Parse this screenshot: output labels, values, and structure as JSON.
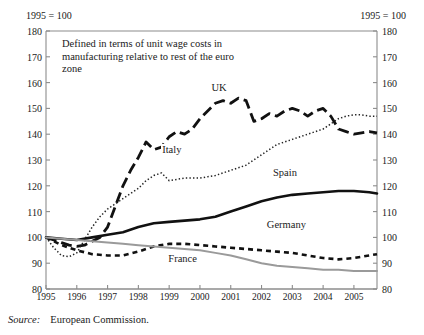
{
  "header": {
    "left_note": "1995 = 100",
    "right_note": "1995 = 100"
  },
  "annotation": "Defined in terms of unit wage costs in manufacturing relative to rest of the euro zone",
  "source": {
    "word": "Source:",
    "body": "European Commission."
  },
  "series_labels": {
    "uk": "UK",
    "italy": "Italy",
    "spain": "Spain",
    "germany": "Germany",
    "france": "France"
  },
  "chart_data": {
    "type": "line",
    "title": "",
    "subtitle": "1995 = 100",
    "xlabel": "",
    "ylabel": "1995 = 100",
    "xlim": [
      1995,
      2005.75
    ],
    "ylim": [
      80,
      180
    ],
    "ytick_step": 10,
    "yticks": [
      80,
      90,
      100,
      110,
      120,
      130,
      140,
      150,
      160,
      170,
      180
    ],
    "xticks": [
      1995,
      1996,
      1997,
      1998,
      1999,
      2000,
      2001,
      2002,
      2003,
      2004,
      2005
    ],
    "xtick_labels": [
      "1995",
      "1996",
      "1997",
      "1998",
      "1999",
      "2000",
      "2001",
      "2002",
      "2003",
      "2004",
      "2005"
    ],
    "grid": false,
    "legend": "inline-annotations",
    "dual_axis": true,
    "annotations": [
      "Defined in terms of unit wage costs in manufacturing relative to rest of the euro zone"
    ],
    "series": [
      {
        "name": "UK",
        "style": "thick-dashed",
        "color": "#111111",
        "x": [
          1995.0,
          1995.25,
          1995.5,
          1995.75,
          1996.0,
          1996.25,
          1996.5,
          1996.75,
          1997.0,
          1997.25,
          1997.5,
          1997.75,
          1998.0,
          1998.25,
          1998.5,
          1998.75,
          1999.0,
          1999.25,
          1999.5,
          1999.75,
          2000.0,
          2000.25,
          2000.5,
          2000.75,
          2001.0,
          2001.25,
          2001.5,
          2001.75,
          2002.0,
          2002.25,
          2002.5,
          2002.75,
          2003.0,
          2003.25,
          2003.5,
          2003.75,
          2004.0,
          2004.25,
          2004.5,
          2004.75,
          2005.0,
          2005.25,
          2005.5,
          2005.75
        ],
        "y": [
          100,
          99,
          98,
          97,
          96.5,
          97,
          98.5,
          100,
          104,
          112,
          120,
          126,
          131,
          137,
          134,
          135,
          139,
          141,
          140,
          142,
          146,
          149,
          152,
          153,
          152,
          154,
          153,
          145,
          146,
          148,
          147,
          149,
          150,
          149,
          147,
          149,
          150,
          147,
          142,
          141,
          140,
          140.5,
          141,
          140.5
        ]
      },
      {
        "name": "Italy",
        "style": "dotted",
        "color": "#222222",
        "x": [
          1995.0,
          1995.25,
          1995.5,
          1995.75,
          1996.0,
          1996.25,
          1996.5,
          1996.75,
          1997.0,
          1997.25,
          1997.5,
          1997.75,
          1998.0,
          1998.25,
          1998.5,
          1998.75,
          1999.0,
          1999.25,
          1999.5,
          1999.75,
          2000.0,
          2000.25,
          2000.5,
          2000.75,
          2001.0,
          2001.25,
          2001.5,
          2001.75,
          2002.0,
          2002.25,
          2002.5,
          2002.75,
          2003.0,
          2003.25,
          2003.5,
          2003.75,
          2004.0,
          2004.25,
          2004.5,
          2004.75,
          2005.0,
          2005.25,
          2005.5,
          2005.75
        ],
        "y": [
          100,
          96,
          93,
          92.5,
          94,
          99,
          104,
          108,
          111,
          113,
          115,
          117,
          119,
          122,
          124,
          125,
          122,
          122.5,
          123,
          123,
          123,
          123.5,
          124,
          125,
          126,
          127,
          128,
          130,
          132,
          134,
          136,
          137,
          138,
          139,
          140,
          141,
          142,
          144,
          146,
          147,
          147.5,
          147.5,
          147,
          147
        ]
      },
      {
        "name": "Spain",
        "style": "thick-solid",
        "color": "#111111",
        "x": [
          1995.0,
          1995.5,
          1996.0,
          1996.5,
          1997.0,
          1997.5,
          1998.0,
          1998.5,
          1999.0,
          1999.5,
          2000.0,
          2000.5,
          2001.0,
          2001.5,
          2002.0,
          2002.5,
          2003.0,
          2003.5,
          2004.0,
          2004.5,
          2005.0,
          2005.5,
          2005.75
        ],
        "y": [
          100,
          99.5,
          99,
          100,
          101,
          102,
          104,
          105.5,
          106,
          106.5,
          107,
          108,
          110,
          112,
          114,
          115.5,
          116.5,
          117,
          117.5,
          118,
          118,
          117.5,
          117
        ]
      },
      {
        "name": "Germany",
        "style": "thick-dashed-small",
        "color": "#111111",
        "x": [
          1995.0,
          1995.5,
          1996.0,
          1996.5,
          1997.0,
          1997.5,
          1998.0,
          1998.5,
          1999.0,
          1999.5,
          2000.0,
          2000.5,
          2001.0,
          2001.5,
          2002.0,
          2002.5,
          2003.0,
          2003.5,
          2004.0,
          2004.5,
          2005.0,
          2005.5,
          2005.75
        ],
        "y": [
          100,
          97,
          95,
          93.5,
          93,
          93,
          94.5,
          96.5,
          97.5,
          97.5,
          97,
          96.5,
          96,
          95.5,
          95,
          94.5,
          94,
          93,
          92,
          91.5,
          92,
          93,
          93.5
        ]
      },
      {
        "name": "France",
        "style": "solid-grey",
        "color": "#9a9a9a",
        "x": [
          1995.0,
          1995.5,
          1996.0,
          1996.5,
          1997.0,
          1997.5,
          1998.0,
          1998.5,
          1999.0,
          1999.5,
          2000.0,
          2000.5,
          2001.0,
          2001.5,
          2002.0,
          2002.5,
          2003.0,
          2003.5,
          2004.0,
          2004.5,
          2005.0,
          2005.5,
          2005.75
        ],
        "y": [
          100,
          99.5,
          99,
          98.5,
          98,
          97.5,
          97,
          96.5,
          96,
          95.5,
          95,
          94,
          93,
          91.5,
          90,
          89,
          88.5,
          88,
          87.5,
          87.5,
          87,
          87,
          87
        ]
      }
    ]
  }
}
